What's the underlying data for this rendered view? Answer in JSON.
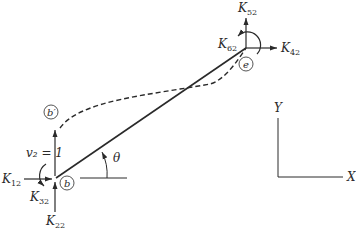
{
  "figure": {
    "type": "structural-element-stiffness-diagram",
    "colors": {
      "ink": "#2a2a2a",
      "background": "#ffffff"
    },
    "nodes": {
      "start": {
        "label": "b"
      },
      "end": {
        "label": "e"
      },
      "displaced_start": {
        "label": "b′"
      }
    },
    "displacement": {
      "label": "v₂ = 1"
    },
    "angle": {
      "label": "θ"
    },
    "forces_start": [
      {
        "name": "K",
        "sub": "12"
      },
      {
        "name": "K",
        "sub": "32"
      },
      {
        "name": "K",
        "sub": "22"
      }
    ],
    "forces_end": [
      {
        "name": "K",
        "sub": "52"
      },
      {
        "name": "K",
        "sub": "62"
      },
      {
        "name": "K",
        "sub": "42"
      }
    ],
    "axes": {
      "x_label": "X",
      "y_label": "Y"
    }
  }
}
